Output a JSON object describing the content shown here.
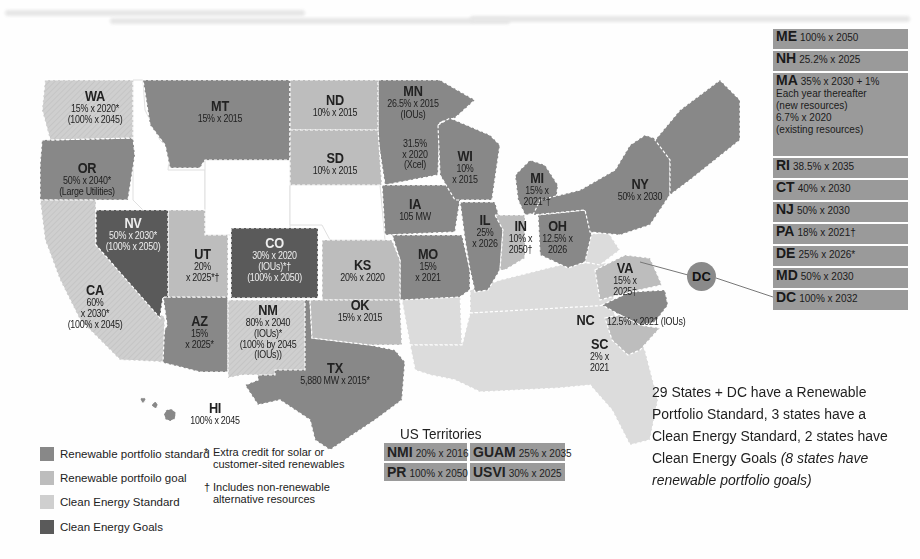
{
  "legend": {
    "items": [
      {
        "label": "Renewable portfolio standard",
        "color": "#888888"
      },
      {
        "label": "Renewable portfoilo goal",
        "color": "#bdbdbd"
      },
      {
        "label": "Clean Energy Standard",
        "color": "#cfcfcf"
      },
      {
        "label": "Clean Energy Goals",
        "color": "#5a5a5a"
      }
    ],
    "notes": [
      {
        "symbol": "*",
        "text": "Extra credit for solar or customer-sited renewables"
      },
      {
        "symbol": "†",
        "text": "Includes non-renewable alternative resources"
      }
    ]
  },
  "states": {
    "WA": {
      "abbr": "WA",
      "text": "15% x 2020*\n(100% x 2045)",
      "category": "Clean Energy Standard"
    },
    "OR": {
      "abbr": "OR",
      "text": "50% x 2040*\n(Large Utilities)",
      "category": "Renewable portfolio standard"
    },
    "CA": {
      "abbr": "CA",
      "text": "60%\nx 2030*\n(100% x 2045)",
      "category": "Clean Energy Standard"
    },
    "NV": {
      "abbr": "NV",
      "text": "50% x 2030*\n(100% x 2050)",
      "category": "Clean Energy Goals"
    },
    "MT": {
      "abbr": "MT",
      "text": "15% x 2015",
      "category": "Renewable portfolio standard"
    },
    "UT": {
      "abbr": "UT",
      "text": "20%\nx 2025*†",
      "category": "Renewable portfoilo goal"
    },
    "CO": {
      "abbr": "CO",
      "text": "30% x 2020\n(IOUs)*†\n(100% x 2050)",
      "category": "Clean Energy Goals"
    },
    "AZ": {
      "abbr": "AZ",
      "text": "15%\nx 2025*",
      "category": "Renewable portfolio standard"
    },
    "NM": {
      "abbr": "NM",
      "text": "80% x 2040\n(IOUs)*\n(100% by 2045\n(IOUs))",
      "category": "Clean Energy Standard"
    },
    "ND": {
      "abbr": "ND",
      "text": "10% x 2015",
      "category": "Renewable portfoilo goal"
    },
    "SD": {
      "abbr": "SD",
      "text": "10% x 2015",
      "category": "Renewable portfoilo goal"
    },
    "KS": {
      "abbr": "KS",
      "text": "20% x 2020",
      "category": "Renewable portfoilo goal"
    },
    "OK": {
      "abbr": "OK",
      "text": "15% x 2015",
      "category": "Renewable portfoilo goal"
    },
    "TX": {
      "abbr": "TX",
      "text": "5,880 MW x 2015*",
      "category": "Renewable portfolio standard"
    },
    "MN": {
      "abbr": "MN",
      "text": "26.5% x 2015\n(IOUs)",
      "text2": "31.5%\nx 2020\n(Xcel)",
      "category": "Renewable portfolio standard"
    },
    "IA": {
      "abbr": "IA",
      "text": "105 MW",
      "category": "Renewable portfolio standard"
    },
    "MO": {
      "abbr": "MO",
      "text": "15%\nx 2021",
      "category": "Renewable portfolio standard"
    },
    "WI": {
      "abbr": "WI",
      "text": "10%\nx 2015",
      "category": "Renewable portfolio standard"
    },
    "IL": {
      "abbr": "IL",
      "text": "25%\nx 2026",
      "category": "Renewable portfolio standard"
    },
    "MI": {
      "abbr": "MI",
      "text": "15% x\n2021*†",
      "category": "Renewable portfolio standard"
    },
    "IN": {
      "abbr": "IN",
      "text": "10% x\n2050†",
      "category": "Renewable portfoilo goal"
    },
    "OH": {
      "abbr": "OH",
      "text": "12.5% x\n2026",
      "category": "Renewable portfolio standard"
    },
    "NY": {
      "abbr": "NY",
      "text": "50% x 2030",
      "category": "Renewable portfolio standard"
    },
    "VA": {
      "abbr": "VA",
      "text": "15% x\n2025†",
      "category": "Renewable portfoilo goal"
    },
    "NC": {
      "abbr": "NC",
      "text": "12.5% x 2021 (IOUs)",
      "category": "Renewable portfolio standard"
    },
    "SC": {
      "abbr": "SC",
      "text": "2% x 2021",
      "category": "Renewable portfoilo goal"
    },
    "HI": {
      "abbr": "HI",
      "text": "100% x 2045",
      "category": "Renewable portfolio standard"
    },
    "DC": {
      "abbr": "DC"
    }
  },
  "northeast": [
    {
      "abbr": "ME",
      "text": "100% x 2050"
    },
    {
      "abbr": "NH",
      "text": "25.2% x 2025"
    },
    {
      "abbr": "MA",
      "text": "35% x 2030 + 1%\nEach year thereafter\n(new resources)\n6.7% x 2020\n(existing resources)"
    },
    {
      "abbr": "RI",
      "text": "38.5% x 2035"
    },
    {
      "abbr": "CT",
      "text": "40% x 2030"
    },
    {
      "abbr": "NJ",
      "text": "50% x 2030"
    },
    {
      "abbr": "PA",
      "text": "18% x 2021†"
    },
    {
      "abbr": "DE",
      "text": "25% x 2026*"
    },
    {
      "abbr": "MD",
      "text": "50% x 2030"
    },
    {
      "abbr": "DC",
      "text": "100% x 2032"
    }
  ],
  "territories": {
    "title": "US Territories",
    "items": [
      {
        "abbr": "NMI",
        "text": "20% x 2016"
      },
      {
        "abbr": "GUAM",
        "text": "25% x 2035"
      },
      {
        "abbr": "PR",
        "text": "100% x 2050"
      },
      {
        "abbr": "USVI",
        "text": "30% x 2025"
      }
    ]
  },
  "summary": {
    "main": "29 States + DC have a Renewable Portfolio Standard, 3 states have a Clean Energy Standard, 2 states have Clean Energy Goals ",
    "italic": "(8 states have renewable portfolio goals)"
  },
  "colors": {
    "rps": "#888888",
    "goal": "#bdbdbd",
    "ces": "#cfcfcf",
    "ceg": "#5a5a5a",
    "none": "#dddddd",
    "box": "#9a9a9a"
  }
}
